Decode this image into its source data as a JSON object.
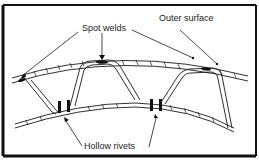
{
  "diagram": {
    "labels": {
      "spot_welds": "Spot welds",
      "outer_surface": "Outer surface",
      "hollow_rivets": "Hollow rivets"
    },
    "colors": {
      "ink": "#1a1a1a",
      "background": "#ffffff",
      "border": "#111111"
    }
  }
}
